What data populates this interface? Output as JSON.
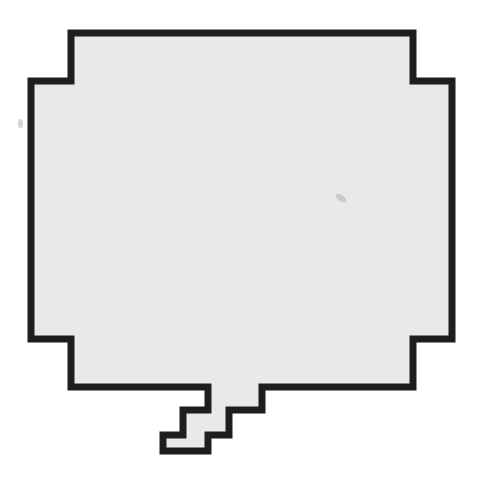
{
  "graphic": {
    "type": "pixel-speech-bubble",
    "text": "",
    "colors": {
      "background": "#ffffff",
      "fill": "#e9e9e9",
      "outline": "#1e1e1e",
      "smudge": "#b8b8b8"
    }
  }
}
